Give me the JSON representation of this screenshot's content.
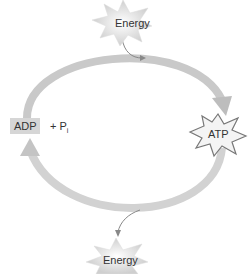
{
  "diagram": {
    "nodes": {
      "energy_in": "Energy",
      "adp": "ADP",
      "phosphate": "+ P",
      "phosphate_subscript": "i",
      "atp": "ATP",
      "energy_out": "Energy"
    },
    "colors": {
      "cycle_arrow": "#c8c8c8",
      "star_fill": "#e0e0e0",
      "adp_box": "#d6d6d6",
      "text": "#333333"
    }
  }
}
